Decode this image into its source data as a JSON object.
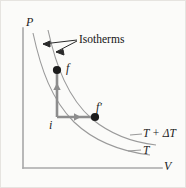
{
  "figure": {
    "type": "pv-diagram",
    "background_color": "#fbfbf9",
    "axes": {
      "y_label": "P",
      "x_label": "V",
      "axis_color": "#a8a8a8",
      "origin": {
        "x": 23,
        "y": 168
      },
      "y_top": {
        "x": 23,
        "y": 28
      },
      "x_right": {
        "x": 162,
        "y": 168
      }
    },
    "annotation": {
      "isotherms_label": "Isotherms",
      "leader_color": "#2a2a2a"
    },
    "curves": [
      {
        "name": "isotherm-T",
        "label": "T",
        "color": "#9a9a9a",
        "description": "lower-left hyperbola passing through point i"
      },
      {
        "name": "isotherm-T-plus-dT",
        "label": "T + ΔT",
        "color": "#9a9a9a",
        "description": "upper-right hyperbola passing through points f and f-prime"
      }
    ],
    "points": [
      {
        "name": "i",
        "label": "i",
        "x": 57,
        "y": 117,
        "color": "#1c1c1c"
      },
      {
        "name": "f",
        "label": "f",
        "x": 57,
        "y": 70,
        "color": "#1c1c1c"
      },
      {
        "name": "fp",
        "label": "f′",
        "x": 95,
        "y": 117,
        "color": "#1c1c1c"
      }
    ],
    "paths": [
      {
        "name": "isochoric-i-to-f",
        "from": "i",
        "to": "f",
        "direction": "up",
        "color": "#8d8d8d"
      },
      {
        "name": "isobaric-i-to-fprime",
        "from": "i",
        "to": "fp",
        "direction": "right",
        "color": "#8d8d8d"
      }
    ]
  }
}
